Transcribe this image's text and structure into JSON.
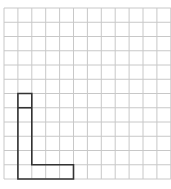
{
  "grid": {
    "origin_x": 4,
    "origin_y": 8,
    "cols": 12,
    "rows": 12,
    "cell_w": 13.9,
    "cell_h": 14.25,
    "line_color": "#c8c8c8"
  },
  "shape": {
    "name": "L-shape",
    "stroke_color": "#333333",
    "outline_cells": [
      [
        1,
        6
      ],
      [
        2,
        6
      ],
      [
        2,
        11
      ],
      [
        5,
        11
      ],
      [
        5,
        12
      ],
      [
        1,
        12
      ]
    ],
    "divider_row": 7
  },
  "caption": ""
}
